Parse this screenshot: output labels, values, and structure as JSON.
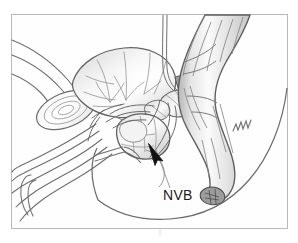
{
  "figure": {
    "kind": "anatomical-line-drawing",
    "border": {
      "visible": true,
      "color": "#b9b9b9",
      "left": 11,
      "top": 14,
      "width": 277,
      "height": 215
    },
    "page_background": "#ffffff",
    "panel_background": "#fefefe",
    "ink_color": "#5a5a5a",
    "dark_ink_color": "#3c3c3c",
    "shade_light": "#f2f2f2",
    "shade_mid": "#d8d8d8",
    "shade_dark": "#b0b0b0"
  },
  "labels": [
    {
      "id": "nvb",
      "text": "NVB",
      "meaning": "neurovascular-bundle",
      "x": 163,
      "y": 199,
      "font_size": 14,
      "color": "#1a1a1a",
      "leader": {
        "visible": true,
        "color": "#8a8a8a",
        "from_x": 170,
        "from_y": 188,
        "to_x": 156,
        "to_y": 150
      },
      "arrow": {
        "visible": true,
        "color": "#111111",
        "tip_x": 149,
        "tip_y": 145,
        "tail_x": 161,
        "tail_y": 160
      }
    }
  ],
  "structures": [
    {
      "id": "bladder",
      "name": "Urinary bladder",
      "region": "upper-left-center"
    },
    {
      "id": "prostate",
      "name": "Prostate gland",
      "region": "center"
    },
    {
      "id": "seminal-vesicles",
      "name": "Seminal vesicles",
      "region": "center-right"
    },
    {
      "id": "rectum",
      "name": "Rectum",
      "region": "right"
    },
    {
      "id": "anal-canal",
      "name": "Anal canal",
      "region": "lower-right"
    },
    {
      "id": "pubic-symphysis",
      "name": "Pubic symphysis",
      "region": "left"
    },
    {
      "id": "penis-urethra",
      "name": "Penis and urethra",
      "region": "lower-left"
    },
    {
      "id": "abdominal-wall",
      "name": "Abdominal wall",
      "region": "upper-left"
    },
    {
      "id": "ureter-catheter",
      "name": "Ureter / catheter tube",
      "region": "top-center"
    },
    {
      "id": "buttock-contour",
      "name": "Buttock contour",
      "region": "lower-right"
    },
    {
      "id": "levator-marking",
      "name": "Levator muscle marking",
      "region": "right-center"
    }
  ]
}
